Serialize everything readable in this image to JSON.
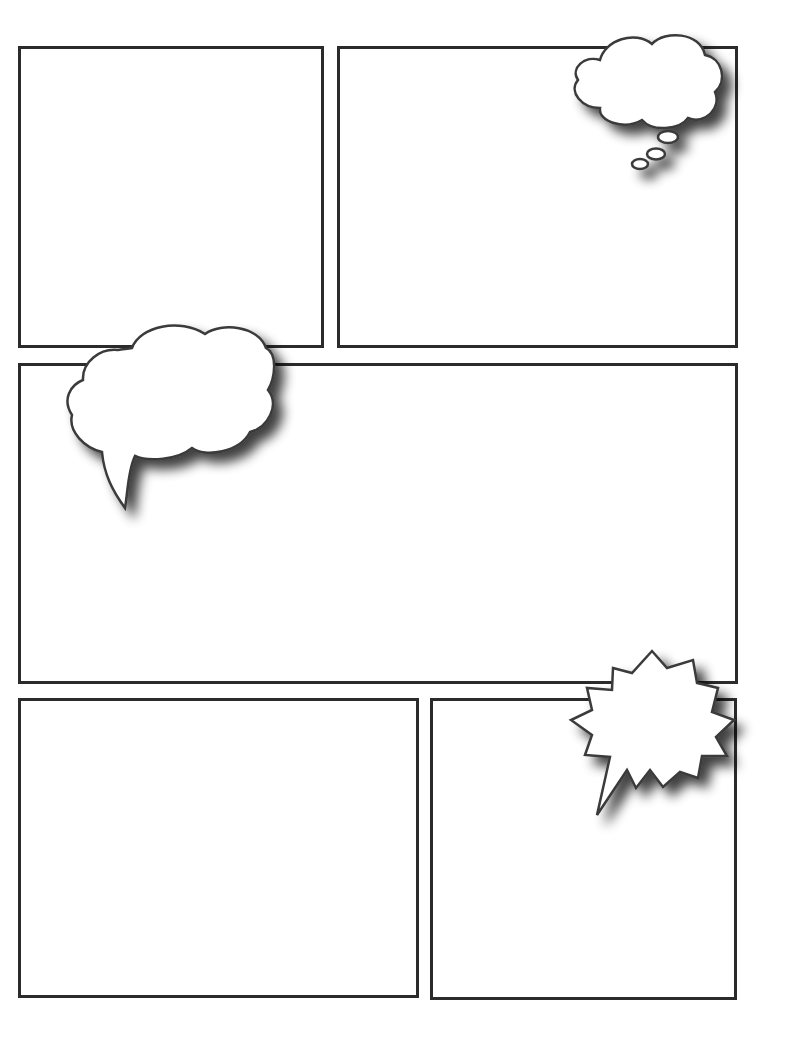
{
  "page": {
    "type": "blank comic page template",
    "background": "#ffffff",
    "border_color": "#2b2b2b",
    "bubble_fill": "#ffffff",
    "bubble_stroke": "#3a3a3a",
    "shadow_color": "#555555"
  },
  "panels": [
    {
      "id": "panel-1",
      "row": 1,
      "position": "top-left",
      "x": 18,
      "y": 46,
      "w": 306,
      "h": 302
    },
    {
      "id": "panel-2",
      "row": 1,
      "position": "top-right",
      "x": 337,
      "y": 46,
      "w": 401,
      "h": 302
    },
    {
      "id": "panel-3",
      "row": 2,
      "position": "middle-wide",
      "x": 18,
      "y": 363,
      "w": 720,
      "h": 321
    },
    {
      "id": "panel-4",
      "row": 3,
      "position": "bottom-left",
      "x": 18,
      "y": 698,
      "w": 401,
      "h": 300
    },
    {
      "id": "panel-5",
      "row": 3,
      "position": "bottom-right",
      "x": 430,
      "y": 698,
      "w": 307,
      "h": 302
    }
  ],
  "bubbles": [
    {
      "id": "thought-bubble",
      "type": "thought",
      "panel": "panel-2",
      "text": ""
    },
    {
      "id": "speech-bubble",
      "type": "speech-cloud",
      "panel": "panel-3",
      "text": ""
    },
    {
      "id": "shout-bubble",
      "type": "burst",
      "panel": "panel-5",
      "text": ""
    }
  ]
}
